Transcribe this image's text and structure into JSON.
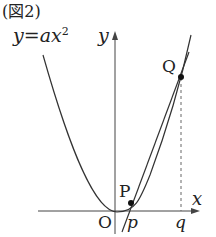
{
  "figure": {
    "caption": "(図2)",
    "equation": "y=ax",
    "equation_exp": "2",
    "axis_y": "y",
    "axis_x": "x",
    "origin": "O",
    "point_p": "P",
    "point_q": "Q",
    "tick_p": "p",
    "tick_q": "q"
  }
}
